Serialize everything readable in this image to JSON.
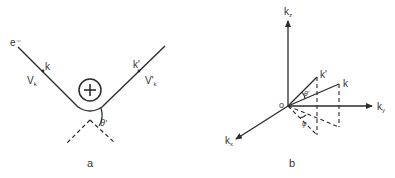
{
  "panels": {
    "a": {
      "caption": "a",
      "electron_label": "e⁻",
      "incoming_wavevector": "k",
      "incoming_velocity": "V",
      "incoming_velocity_sub": "k",
      "outgoing_wavevector": "k'",
      "outgoing_velocity": "V'",
      "outgoing_velocity_sub": "k",
      "ion_symbol": "+",
      "scattering_angle": "θ'"
    },
    "b": {
      "caption": "b",
      "axis_z": "k",
      "axis_z_sub": "z",
      "axis_y": "k",
      "axis_y_sub": "y",
      "axis_x": "k",
      "axis_x_sub": "x",
      "origin": "o",
      "vector_k": "k",
      "vector_k_prime": "k'",
      "polar_angle": "θ'",
      "azimuth_angle": "φ"
    }
  },
  "colors": {
    "stroke": "#2b2b2b",
    "text": "#333333",
    "background": "#ffffff"
  }
}
